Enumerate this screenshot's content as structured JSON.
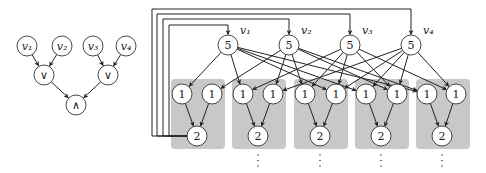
{
  "left_graph": {
    "nodes": [
      {
        "id": "v1",
        "label": "v₁",
        "x": 27,
        "y": 46
      },
      {
        "id": "v2",
        "label": "v₂",
        "x": 62,
        "y": 46
      },
      {
        "id": "v3",
        "label": "v₃",
        "x": 93,
        "y": 46
      },
      {
        "id": "v4",
        "label": "v₄",
        "x": 126,
        "y": 46
      },
      {
        "id": "or1",
        "label": "∨",
        "x": 44,
        "y": 75
      },
      {
        "id": "or2",
        "label": "∨",
        "x": 108,
        "y": 75
      },
      {
        "id": "and",
        "label": "∧",
        "x": 76,
        "y": 105
      }
    ],
    "edges": [
      [
        "v1",
        "or1"
      ],
      [
        "v2",
        "or1"
      ],
      [
        "v3",
        "or2"
      ],
      [
        "v4",
        "or2"
      ],
      [
        "or1",
        "and"
      ],
      [
        "or2",
        "and"
      ]
    ]
  },
  "right_graph": {
    "variable_nodes": [
      {
        "id": "n_v1",
        "label": "5",
        "var_label": "v₁",
        "x": 228,
        "y": 45
      },
      {
        "id": "n_v2",
        "label": "5",
        "var_label": "v₂",
        "x": 289,
        "y": 45
      },
      {
        "id": "n_v3",
        "label": "5",
        "var_label": "v₃",
        "x": 350,
        "y": 45
      },
      {
        "id": "n_v4",
        "label": "5",
        "var_label": "v₄",
        "x": 411,
        "y": 45
      }
    ],
    "gadgets": [
      {
        "box": {
          "x": 171,
          "y": 79,
          "w": 54,
          "h": 70
        },
        "inputs": [
          {
            "label": "1",
            "x": 182,
            "y": 94
          },
          {
            "label": "1",
            "x": 212,
            "y": 94
          }
        ],
        "output": {
          "label": "2",
          "x": 197,
          "y": 136
        },
        "dots": false
      },
      {
        "box": {
          "x": 232,
          "y": 79,
          "w": 54,
          "h": 70
        },
        "inputs": [
          {
            "label": "1",
            "x": 243,
            "y": 94
          },
          {
            "label": "1",
            "x": 273,
            "y": 94
          }
        ],
        "output": {
          "label": "2",
          "x": 258,
          "y": 136
        },
        "dots": true
      },
      {
        "box": {
          "x": 294,
          "y": 79,
          "w": 54,
          "h": 70
        },
        "inputs": [
          {
            "label": "1",
            "x": 305,
            "y": 94
          },
          {
            "label": "1",
            "x": 336,
            "y": 94
          }
        ],
        "output": {
          "label": "2",
          "x": 320,
          "y": 136
        },
        "dots": true
      },
      {
        "box": {
          "x": 355,
          "y": 79,
          "w": 54,
          "h": 70
        },
        "inputs": [
          {
            "label": "1",
            "x": 366,
            "y": 94
          },
          {
            "label": "1",
            "x": 397,
            "y": 94
          }
        ],
        "output": {
          "label": "2",
          "x": 381,
          "y": 136
        },
        "dots": true
      },
      {
        "box": {
          "x": 416,
          "y": 79,
          "w": 54,
          "h": 70
        },
        "inputs": [
          {
            "label": "1",
            "x": 427,
            "y": 94
          },
          {
            "label": "1",
            "x": 456,
            "y": 94
          }
        ],
        "output": {
          "label": "2",
          "x": 442,
          "y": 136
        },
        "dots": true
      }
    ],
    "var_edges": [
      [
        0,
        [
          0,
          0
        ]
      ],
      [
        0,
        [
          1,
          0
        ]
      ],
      [
        0,
        [
          2,
          1
        ]
      ],
      [
        0,
        [
          3,
          0
        ]
      ],
      [
        0,
        [
          4,
          0
        ]
      ],
      [
        1,
        [
          0,
          1
        ]
      ],
      [
        1,
        [
          1,
          1
        ]
      ],
      [
        1,
        [
          2,
          0
        ]
      ],
      [
        1,
        [
          3,
          1
        ]
      ],
      [
        1,
        [
          4,
          0
        ]
      ],
      [
        2,
        [
          1,
          0
        ]
      ],
      [
        2,
        [
          2,
          0
        ]
      ],
      [
        2,
        [
          2,
          1
        ]
      ],
      [
        2,
        [
          3,
          1
        ]
      ],
      [
        2,
        [
          4,
          1
        ]
      ],
      [
        3,
        [
          1,
          1
        ]
      ],
      [
        3,
        [
          2,
          1
        ]
      ],
      [
        3,
        [
          3,
          0
        ]
      ],
      [
        3,
        [
          3,
          1
        ]
      ],
      [
        3,
        [
          4,
          1
        ]
      ]
    ],
    "feedback": [
      {
        "target": 3,
        "vx": 152,
        "hy": 9
      },
      {
        "target": 2,
        "vx": 157,
        "hy": 14
      },
      {
        "target": 1,
        "vx": 163,
        "hy": 19
      },
      {
        "target": 0,
        "vx": 169,
        "hy": 25
      }
    ],
    "feedback_source_gadget": 0
  }
}
